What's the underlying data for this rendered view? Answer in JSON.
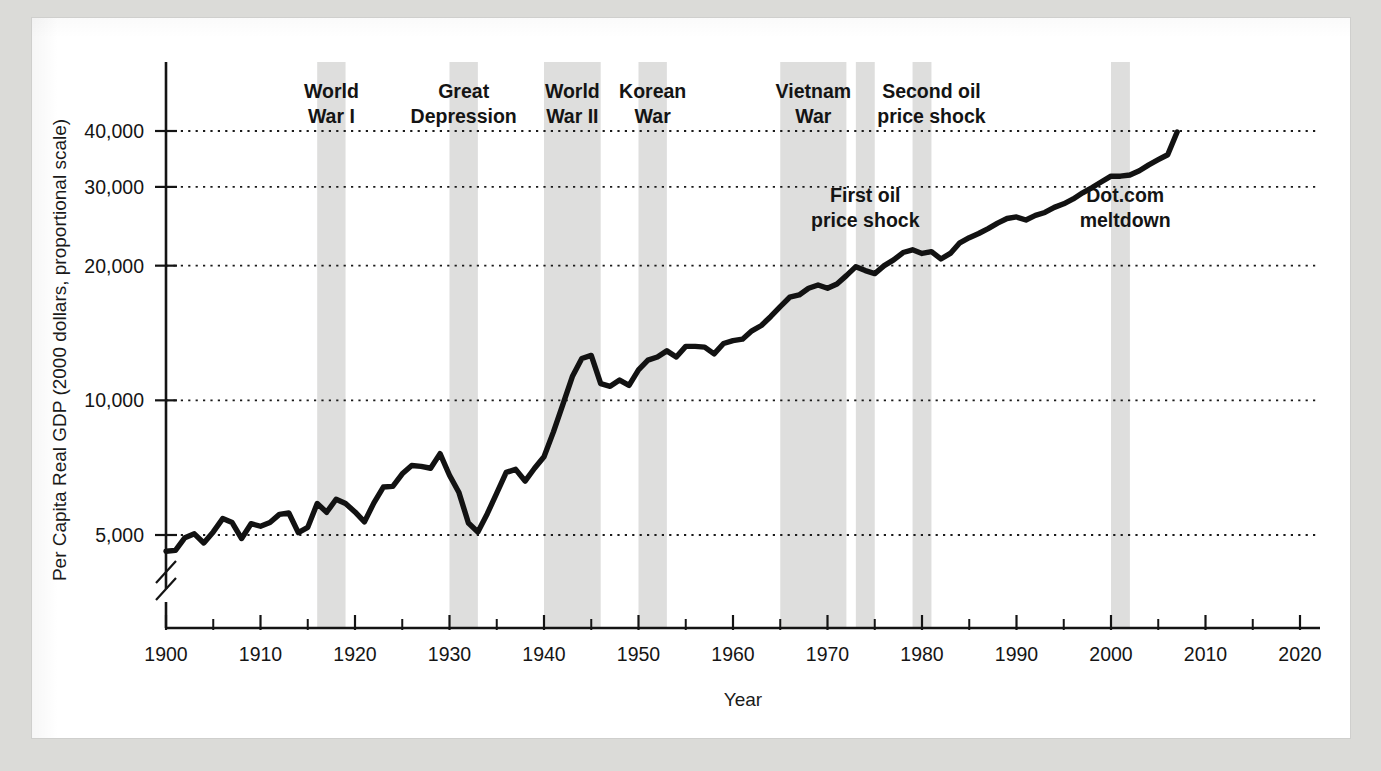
{
  "figure": {
    "background": "#ffffff",
    "page_background": "#dbdbd8",
    "line_color": "#121212",
    "band_color": "#dededd"
  },
  "chart_data": {
    "type": "line",
    "title": "",
    "xlabel": "Year",
    "ylabel": "Per Capita Real GDP (2000 dollars, proportional scale)",
    "yscale": "log",
    "ylim": [
      4000,
      48000
    ],
    "xlim": [
      1900,
      2020
    ],
    "grid": true,
    "legend": "none",
    "x_ticks_major": [
      1900,
      1910,
      1920,
      1930,
      1940,
      1950,
      1960,
      1970,
      1980,
      1990,
      2000,
      2010,
      2020
    ],
    "x_ticks_minor": [
      1905,
      1915,
      1925,
      1935,
      1945,
      1955,
      1965,
      1975,
      1985,
      1995,
      2005,
      2015
    ],
    "x_tick_labels": [
      "1900",
      "1910",
      "1920",
      "1930",
      "1940",
      "1950",
      "1960",
      "1970",
      "1980",
      "1990",
      "2000",
      "2010",
      "2020"
    ],
    "y_ticks": [
      5000,
      10000,
      20000,
      30000,
      40000
    ],
    "y_tick_labels": [
      "5,000",
      "10,000",
      "20,000",
      "30,000",
      "40,000"
    ],
    "axis_break": true,
    "series": [
      {
        "name": "Per Capita Real GDP",
        "x": [
          1900,
          1901,
          1902,
          1903,
          1904,
          1905,
          1906,
          1907,
          1908,
          1909,
          1910,
          1911,
          1912,
          1913,
          1914,
          1915,
          1916,
          1917,
          1918,
          1919,
          1920,
          1921,
          1922,
          1923,
          1924,
          1925,
          1926,
          1927,
          1928,
          1929,
          1930,
          1931,
          1932,
          1933,
          1934,
          1935,
          1936,
          1937,
          1938,
          1939,
          1940,
          1941,
          1942,
          1943,
          1944,
          1945,
          1946,
          1947,
          1948,
          1949,
          1950,
          1951,
          1952,
          1953,
          1954,
          1955,
          1956,
          1957,
          1958,
          1959,
          1960,
          1961,
          1962,
          1963,
          1964,
          1965,
          1966,
          1967,
          1968,
          1969,
          1970,
          1971,
          1972,
          1973,
          1974,
          1975,
          1976,
          1977,
          1978,
          1979,
          1980,
          1981,
          1982,
          1983,
          1984,
          1985,
          1986,
          1987,
          1988,
          1989,
          1990,
          1991,
          1992,
          1993,
          1994,
          1995,
          1996,
          1997,
          1998,
          1999,
          2000,
          2001,
          2002,
          2003,
          2004,
          2005,
          2006,
          2007
        ],
        "y": [
          4600,
          4620,
          4930,
          5030,
          4800,
          5080,
          5440,
          5330,
          4910,
          5300,
          5230,
          5330,
          5560,
          5600,
          5060,
          5200,
          5880,
          5620,
          6010,
          5880,
          5630,
          5350,
          5900,
          6400,
          6420,
          6850,
          7150,
          7120,
          7050,
          7600,
          6800,
          6220,
          5320,
          5080,
          5580,
          6200,
          6900,
          7010,
          6600,
          7050,
          7480,
          8500,
          9800,
          11300,
          12400,
          12600,
          10900,
          10750,
          11100,
          10800,
          11700,
          12300,
          12500,
          12900,
          12500,
          13200,
          13200,
          13150,
          12700,
          13400,
          13600,
          13700,
          14300,
          14700,
          15400,
          16200,
          17000,
          17200,
          17800,
          18100,
          17800,
          18200,
          19000,
          19900,
          19500,
          19200,
          20000,
          20600,
          21400,
          21700,
          21300,
          21500,
          20700,
          21300,
          22500,
          23100,
          23600,
          24200,
          24900,
          25500,
          25700,
          25300,
          25900,
          26300,
          27000,
          27500,
          28200,
          29100,
          29900,
          30800,
          31700,
          31700,
          31900,
          32600,
          33600,
          34500,
          35400,
          39800
        ]
      }
    ],
    "shaded_bands": [
      {
        "label": "World War I",
        "start": 1916,
        "end": 1919
      },
      {
        "label": "Great Depression",
        "start": 1930,
        "end": 1933
      },
      {
        "label": "World War II",
        "start": 1940,
        "end": 1946
      },
      {
        "label": "Korean War",
        "start": 1950,
        "end": 1953
      },
      {
        "label": "Vietnam War",
        "start": 1965,
        "end": 1972
      },
      {
        "label": "First oil price shock",
        "start": 1973,
        "end": 1975
      },
      {
        "label": "Second oil price shock",
        "start": 1979,
        "end": 1981
      },
      {
        "label": "Dot.com meltdown",
        "start": 2000,
        "end": 2002
      }
    ],
    "annotations": [
      {
        "id": "ww1",
        "lines": [
          "World",
          "War I"
        ],
        "x": 1917.5,
        "row": "top"
      },
      {
        "id": "depression",
        "lines": [
          "Great",
          "Depression"
        ],
        "x": 1931.5,
        "row": "top"
      },
      {
        "id": "ww2",
        "lines": [
          "World",
          "War II"
        ],
        "x": 1943.0,
        "row": "top"
      },
      {
        "id": "korea",
        "lines": [
          "Korean",
          "War"
        ],
        "x": 1951.5,
        "row": "top"
      },
      {
        "id": "vietnam",
        "lines": [
          "Vietnam",
          "War"
        ],
        "x": 1968.5,
        "row": "top"
      },
      {
        "id": "oil2",
        "lines": [
          "Second oil",
          "price shock"
        ],
        "x": 1981.0,
        "row": "top"
      },
      {
        "id": "oil1",
        "lines": [
          "First oil",
          "price shock"
        ],
        "x": 1974.0,
        "row": "mid"
      },
      {
        "id": "dotcom",
        "lines": [
          "Dot.com",
          "meltdown"
        ],
        "x": 2001.5,
        "row": "mid"
      }
    ]
  }
}
